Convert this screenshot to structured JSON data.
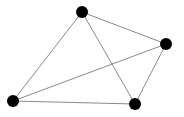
{
  "graph": {
    "type": "undirected-graph",
    "background": "#ffffff",
    "node_color": "#000000",
    "edge_color": "#8a8a8a",
    "node_radius": 6,
    "edge_width": 1,
    "nodes": [
      {
        "id": "top",
        "x": 82,
        "y": 12
      },
      {
        "id": "right",
        "x": 166,
        "y": 44
      },
      {
        "id": "bottom-left",
        "x": 13,
        "y": 101
      },
      {
        "id": "bottom-right",
        "x": 135,
        "y": 104
      }
    ],
    "edges": [
      {
        "from": "top",
        "to": "right"
      },
      {
        "from": "top",
        "to": "bottom-left"
      },
      {
        "from": "top",
        "to": "bottom-right"
      },
      {
        "from": "right",
        "to": "bottom-left"
      },
      {
        "from": "right",
        "to": "bottom-right"
      },
      {
        "from": "bottom-left",
        "to": "bottom-right"
      }
    ]
  }
}
